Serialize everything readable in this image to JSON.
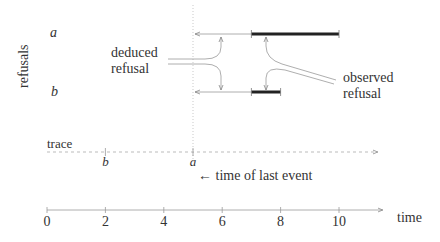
{
  "diagram": {
    "y_axis_label": "refusals",
    "event_labels": {
      "a": "a",
      "b": "b"
    },
    "annotations": {
      "deduced_line1": "deduced",
      "deduced_line2": "refusal",
      "observed_line1": "observed",
      "observed_line2": "refusal",
      "trace": "trace",
      "last_event": "← time of last event"
    },
    "time_axis": {
      "label": "time",
      "ticks": [
        "0",
        "2",
        "4",
        "6",
        "8",
        "10"
      ],
      "tick_values": [
        0,
        2,
        4,
        6,
        8,
        10
      ],
      "max": 11.5
    },
    "trace_events": [
      {
        "name": "b",
        "time": 2
      },
      {
        "name": "a",
        "time": 5
      }
    ],
    "time_of_last_event": 5,
    "observed_refusals": [
      {
        "event": "a",
        "start": 7,
        "end": 10
      },
      {
        "event": "b",
        "start": 7,
        "end": 8
      }
    ],
    "deduced_refusals": [
      {
        "event": "a",
        "from": 7,
        "to": 5
      },
      {
        "event": "b",
        "from": 7,
        "to": 5
      }
    ]
  }
}
